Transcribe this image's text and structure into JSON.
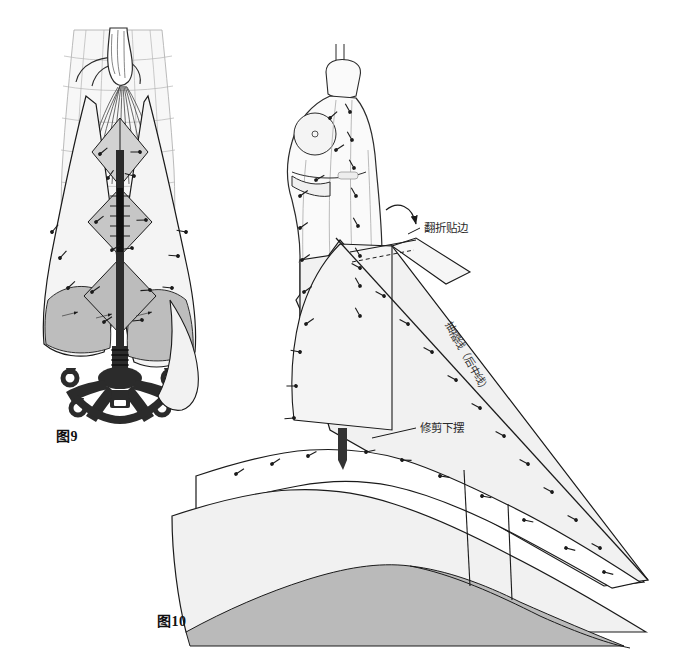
{
  "page": {
    "kind": "technical-sewing-illustration",
    "background_color": "#ffffff",
    "width": 686,
    "height": 659
  },
  "figures": [
    {
      "id": "figure-9",
      "caption": "图9",
      "subject": "front view of draped skirt on dress form with rolling base",
      "description_cn": "前视图：人台上悬垂裙片与滚轮底座"
    },
    {
      "id": "figure-10",
      "caption": "图10",
      "subject": "side view of dress form with bias-cut panel pinned, fold-over facing and hem trimming",
      "description_cn": "侧视图：人台别好斜裁裙片、翻折贴边与修剪下摆"
    }
  ],
  "labels": {
    "fold_facing": "翻折贴边",
    "trim_hem": "修剪下摆",
    "gather_line": "抽褶线（后中线）"
  },
  "colors": {
    "outline": "#1a1a1a",
    "light_outline": "#8d8d8d",
    "fabric_fill": "#f2f2f2",
    "fabric_fill_2": "#ececec",
    "shade_gray": "#b9b9b9",
    "mid_gray": "#cfcfcf",
    "dark_metal": "#3a3a3a",
    "stand_black": "#262626",
    "paper_white": "#ffffff"
  }
}
